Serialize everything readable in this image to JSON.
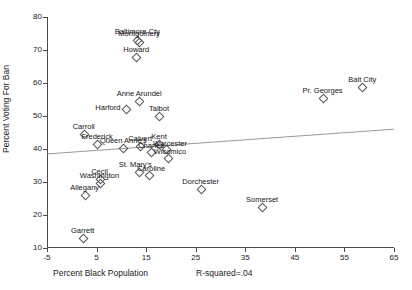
{
  "chart_data": {
    "type": "scatter",
    "title": "",
    "xlabel": "Percent Black Population",
    "ylabel": "Percent Voting For Ban",
    "annotation": "R-squared=.04",
    "xlim": [
      -5,
      65
    ],
    "ylim": [
      10,
      80
    ],
    "xticks": [
      -5,
      5,
      15,
      25,
      35,
      45,
      55,
      65
    ],
    "yticks": [
      10,
      20,
      30,
      40,
      50,
      60,
      70,
      80
    ],
    "grid": false,
    "legend": "none",
    "marker": "open-diamond",
    "points": [
      {
        "label": "Baltimore Cty",
        "x": 13.2,
        "y": 73.0,
        "lx": 0,
        "ly": -9
      },
      {
        "label": "Montgomery",
        "x": 13.6,
        "y": 72.4,
        "lx": 0,
        "ly": -9
      },
      {
        "label": "Howard",
        "x": 13.0,
        "y": 68.0,
        "lx": 0,
        "ly": -8
      },
      {
        "label": "Anne Arundel",
        "x": 13.6,
        "y": 54.6,
        "lx": 0,
        "ly": -8
      },
      {
        "label": "Harford",
        "x": 10.9,
        "y": 52.0,
        "lx": -18,
        "ly": -2
      },
      {
        "label": "Talbot",
        "x": 17.6,
        "y": 50.0,
        "lx": 0,
        "ly": -8
      },
      {
        "label": "Carroll",
        "x": 2.4,
        "y": 44.6,
        "lx": 0,
        "ly": -8
      },
      {
        "label": "Frederick",
        "x": 5.1,
        "y": 41.4,
        "lx": 0,
        "ly": -8
      },
      {
        "label": "Queen Anne's",
        "x": 10.4,
        "y": 40.2,
        "lx": 0,
        "ly": -8
      },
      {
        "label": "Calvert",
        "x": 13.8,
        "y": 41.0,
        "lx": 0,
        "ly": -8
      },
      {
        "label": "Kent",
        "x": 17.6,
        "y": 41.4,
        "lx": 0,
        "ly": -8
      },
      {
        "label": "Worcester",
        "x": 19.0,
        "y": 40.0,
        "lx": 4,
        "ly": -6
      },
      {
        "label": "Charles",
        "x": 16.0,
        "y": 39.0,
        "lx": 0,
        "ly": -7
      },
      {
        "label": "Wicomico",
        "x": 19.4,
        "y": 37.4,
        "lx": 2,
        "ly": -7
      },
      {
        "label": "St. Mary's",
        "x": 13.6,
        "y": 33.0,
        "lx": -4,
        "ly": -8
      },
      {
        "label": "Caroline",
        "x": 15.6,
        "y": 32.2,
        "lx": 2,
        "ly": -7
      },
      {
        "label": "Cecil",
        "x": 5.6,
        "y": 31.0,
        "lx": 0,
        "ly": -8
      },
      {
        "label": "Washington",
        "x": 5.6,
        "y": 29.8,
        "lx": 0,
        "ly": -8
      },
      {
        "label": "Allegany",
        "x": 2.6,
        "y": 26.2,
        "lx": 0,
        "ly": -8
      },
      {
        "label": "Dorchester",
        "x": 26.0,
        "y": 28.0,
        "lx": 0,
        "ly": -8
      },
      {
        "label": "Somerset",
        "x": 38.4,
        "y": 22.4,
        "lx": 0,
        "ly": -8
      },
      {
        "label": "Garrett",
        "x": 2.2,
        "y": 13.0,
        "lx": 0,
        "ly": -8
      },
      {
        "label": "Pr. Georges",
        "x": 50.6,
        "y": 55.6,
        "lx": 0,
        "ly": -8
      },
      {
        "label": "Balt City",
        "x": 58.6,
        "y": 58.8,
        "lx": 0,
        "ly": -8
      }
    ],
    "fit_line": {
      "x0": -5,
      "y0": 38.5,
      "x1": 65,
      "y1": 46.0
    }
  }
}
